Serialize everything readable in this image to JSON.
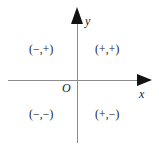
{
  "diagram": {
    "type": "cartesian-quadrant-sign-chart",
    "axes": {
      "x_label": "x",
      "y_label": "y",
      "origin_label": "O"
    },
    "quadrants": [
      {
        "id": "I",
        "name": "quadrant-1",
        "label": "(+,+)"
      },
      {
        "id": "II",
        "name": "quadrant-2",
        "label": "(−,+)"
      },
      {
        "id": "III",
        "name": "quadrant-3",
        "label": "(−,−)"
      },
      {
        "id": "IV",
        "name": "quadrant-4",
        "label": "(+,−)"
      }
    ],
    "colors": {
      "background": "#ffffff",
      "axis_line": "#8c8c8c",
      "arrowhead": "#121212",
      "text": "#1a1a1a"
    },
    "icons": {
      "y_arrow": "arrow-up-icon",
      "x_arrow": "arrow-right-icon"
    }
  }
}
